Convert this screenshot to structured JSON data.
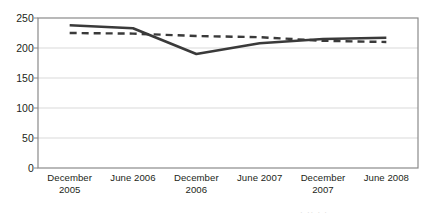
{
  "chart_data": {
    "type": "line",
    "title": "",
    "subtitle": "",
    "xlabel": "",
    "ylabel": "",
    "ylim": [
      0,
      250
    ],
    "ytick_values": [
      250,
      200,
      150,
      100,
      50,
      0
    ],
    "ytick_labels": [
      "250",
      "200",
      "150",
      "100",
      "50",
      "0"
    ],
    "grid": true,
    "grid_axis": "y",
    "legend": "none",
    "categories": [
      "December\n2005",
      "June 2006",
      "December\n2006",
      "June 2007",
      "December\n2007",
      "June 2008"
    ],
    "categories_flat": [
      "December 2005",
      "June 2006",
      "December 2006",
      "June 2007",
      "December 2007",
      "June 2008"
    ],
    "series": [
      {
        "name": "solid-series",
        "style": "solid",
        "color": "#3a3a3a",
        "width": 2.6,
        "values": [
          238,
          233,
          190,
          208,
          215,
          217
        ]
      },
      {
        "name": "dashed-series",
        "style": "dashed",
        "color": "#3a3a3a",
        "width": 2.4,
        "values": [
          225,
          224,
          220,
          218,
          212,
          210
        ]
      }
    ]
  },
  "axes": {
    "y_labels": [
      "250",
      "200",
      "150",
      "100",
      "50",
      "0"
    ],
    "x_labels": [
      "December\n2005",
      "June 2006",
      "December\n2006",
      "June 2007",
      "December\n2007",
      "June 2008"
    ]
  },
  "colors": {
    "line": "#3a3a3a",
    "axis": "#8a8a8a",
    "grid": "#d9d9d9",
    "text": "#231f20",
    "background": "#ffffff"
  },
  "footer": {
    "fragment_text": "·   ·· ·   ·"
  }
}
